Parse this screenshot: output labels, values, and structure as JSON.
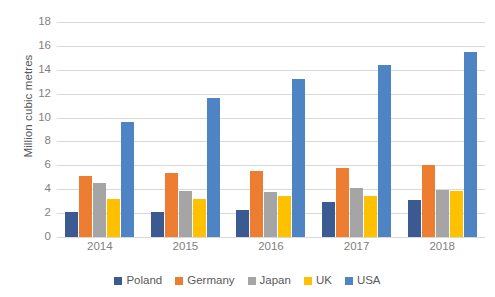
{
  "chart_data": {
    "type": "bar",
    "title": "",
    "xlabel": "",
    "ylabel": "Million cubic metres",
    "ylim": [
      0,
      18
    ],
    "ytick_step": 2,
    "yticks": [
      18,
      16,
      14,
      12,
      10,
      8,
      6,
      4,
      2,
      0
    ],
    "grid": true,
    "legend_position": "bottom",
    "categories": [
      "2014",
      "2015",
      "2016",
      "2017",
      "2018"
    ],
    "series": [
      {
        "name": "Poland",
        "color": "#3B5A92",
        "values": [
          2.1,
          2.1,
          2.3,
          2.9,
          3.1
        ]
      },
      {
        "name": "Germany",
        "color": "#ED7D31",
        "values": [
          5.15,
          5.4,
          5.55,
          5.75,
          6.0
        ]
      },
      {
        "name": "Japan",
        "color": "#A5A5A5",
        "values": [
          4.5,
          3.85,
          3.8,
          4.1,
          3.95
        ]
      },
      {
        "name": "UK",
        "color": "#FFC000",
        "values": [
          3.2,
          3.15,
          3.4,
          3.45,
          3.85
        ]
      },
      {
        "name": "USA",
        "color": "#4E84C4",
        "values": [
          9.65,
          11.65,
          13.2,
          14.4,
          15.5
        ]
      }
    ]
  }
}
